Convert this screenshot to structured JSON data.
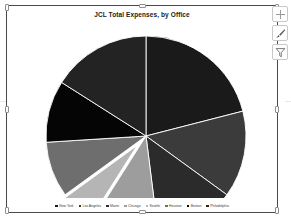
{
  "chart": {
    "title": "JCL Total Expenses, by Office",
    "selected": true,
    "side_buttons": [
      {
        "name": "chart-elements-button",
        "icon": "plus-icon",
        "label": "Chart Elements"
      },
      {
        "name": "chart-styles-button",
        "icon": "brush-icon",
        "label": "Chart Styles"
      },
      {
        "name": "chart-filters-button",
        "icon": "funnel-icon",
        "label": "Chart Filters"
      }
    ]
  },
  "chart_data": {
    "type": "pie",
    "title": "JCL Total Expenses, by Office",
    "xlabel": "",
    "ylabel": "",
    "legend_position": "bottom",
    "grid": false,
    "exploded_slices": [
      "Seattle"
    ],
    "categories": [
      "New York",
      "Los Angeles",
      "Miami",
      "Chicago",
      "Seattle",
      "Houston",
      "Boston",
      "Philadelphia"
    ],
    "values": [
      21,
      14,
      13,
      11,
      6,
      9,
      10,
      16
    ],
    "colors": [
      "#1a1a1a",
      "#3b3b3b",
      "#2b2b2b",
      "#9d9d9d",
      "#b5b5b5",
      "#6e6e6e",
      "#050505",
      "#232323"
    ],
    "series": [
      {
        "name": "Total Expenses",
        "values": [
          21,
          14,
          13,
          11,
          6,
          9,
          10,
          16
        ]
      }
    ]
  }
}
